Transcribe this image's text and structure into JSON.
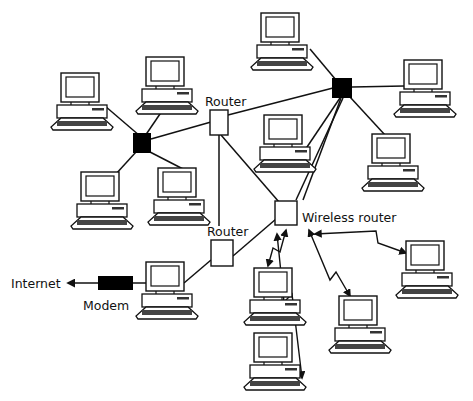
{
  "diagram": {
    "labels": {
      "router_top": "Router",
      "router_bottom": "Router",
      "wireless_router": "Wireless router",
      "modem": "Modem",
      "internet": "Internet"
    },
    "nodes": [
      {
        "id": "hub-left",
        "type": "hub"
      },
      {
        "id": "hub-right",
        "type": "hub"
      },
      {
        "id": "router-top",
        "type": "router",
        "label_key": "router_top"
      },
      {
        "id": "router-bottom",
        "type": "router",
        "label_key": "router_bottom"
      },
      {
        "id": "wireless-router",
        "type": "wireless-router",
        "label_key": "wireless_router"
      },
      {
        "id": "modem",
        "type": "modem",
        "label_key": "modem"
      },
      {
        "id": "pc-1",
        "type": "computer"
      },
      {
        "id": "pc-2",
        "type": "computer"
      },
      {
        "id": "pc-3",
        "type": "computer"
      },
      {
        "id": "pc-4",
        "type": "computer"
      },
      {
        "id": "pc-5",
        "type": "computer"
      },
      {
        "id": "pc-6",
        "type": "computer"
      },
      {
        "id": "pc-7",
        "type": "computer"
      },
      {
        "id": "pc-8",
        "type": "computer"
      },
      {
        "id": "pc-9",
        "type": "computer"
      },
      {
        "id": "pc-10",
        "type": "computer"
      },
      {
        "id": "pc-11",
        "type": "computer"
      },
      {
        "id": "pc-12",
        "type": "computer"
      },
      {
        "id": "pc-13",
        "type": "computer"
      }
    ],
    "wired_links": [
      [
        "pc-1",
        "hub-left"
      ],
      [
        "pc-2",
        "hub-left"
      ],
      [
        "pc-3",
        "hub-left"
      ],
      [
        "pc-4",
        "hub-left"
      ],
      [
        "hub-left",
        "router-top"
      ],
      [
        "router-top",
        "hub-right"
      ],
      [
        "pc-5",
        "hub-right"
      ],
      [
        "pc-6",
        "hub-right"
      ],
      [
        "pc-7",
        "hub-right"
      ],
      [
        "pc-8",
        "hub-right"
      ],
      [
        "hub-right",
        "wireless-router"
      ],
      [
        "router-top",
        "router-bottom"
      ],
      [
        "router-top",
        "wireless-router"
      ],
      [
        "router-bottom",
        "wireless-router"
      ],
      [
        "router-bottom",
        "pc-9"
      ],
      [
        "pc-9",
        "modem"
      ]
    ],
    "wireless_links": [
      [
        "wireless-router",
        "pc-10"
      ],
      [
        "wireless-router",
        "pc-11"
      ],
      [
        "wireless-router",
        "pc-12"
      ],
      [
        "wireless-router",
        "pc-13"
      ]
    ],
    "external_links": [
      [
        "modem",
        "internet"
      ]
    ]
  }
}
